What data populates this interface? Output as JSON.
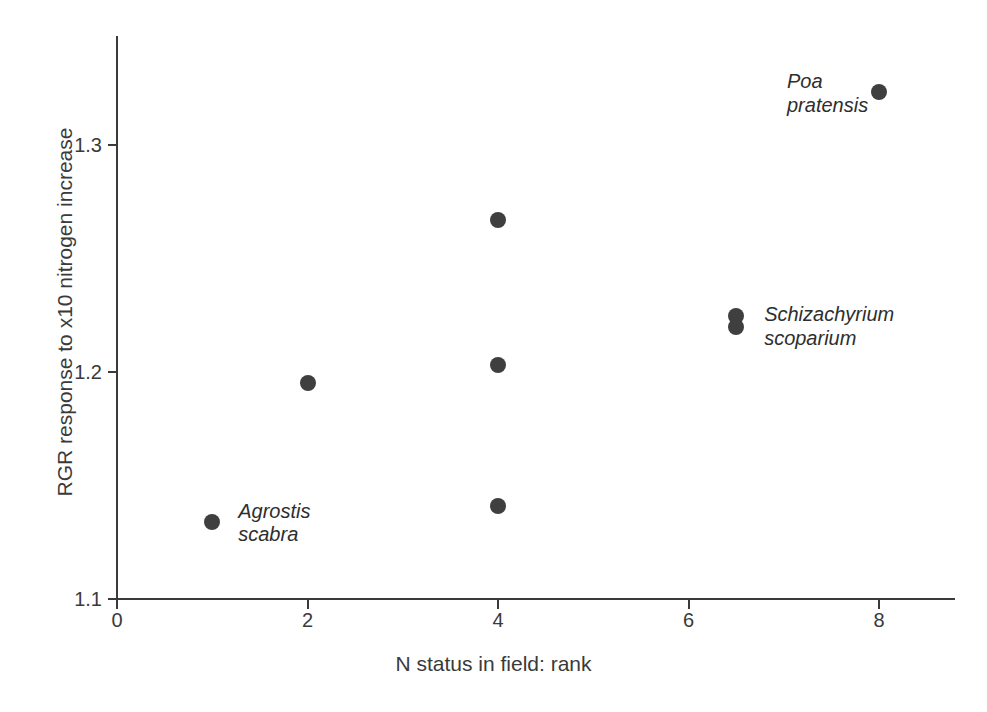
{
  "chart_data": {
    "type": "scatter",
    "title": "",
    "xlabel": "N status in field: rank",
    "ylabel": "RGR response to x10 nitrogen increase",
    "xlim": [
      0,
      8.75
    ],
    "ylim": [
      1.1,
      1.348
    ],
    "xticks": [
      0,
      2,
      4,
      6,
      8
    ],
    "xticklabels": [
      "0",
      "2",
      "4",
      "6",
      "8"
    ],
    "yticks": [
      1.1,
      1.2,
      1.3
    ],
    "yticklabels": [
      "1.1",
      "1.2",
      "1.3"
    ],
    "grid": false,
    "legend": "none",
    "marker_color": "#3f3f3f",
    "axis_color": "#3a3a3a",
    "points": [
      {
        "x": 1,
        "y": 1.134,
        "label": "Agrostis\nscabra",
        "label_dx": 26,
        "label_dy": -22
      },
      {
        "x": 2,
        "y": 1.195,
        "label": "",
        "label_dx": 0,
        "label_dy": 0
      },
      {
        "x": 4,
        "y": 1.267,
        "label": "",
        "label_dx": 0,
        "label_dy": 0
      },
      {
        "x": 4,
        "y": 1.203,
        "label": "",
        "label_dx": 0,
        "label_dy": 0
      },
      {
        "x": 4,
        "y": 1.141,
        "label": "",
        "label_dx": 0,
        "label_dy": 0
      },
      {
        "x": 6.5,
        "y": 1.2246,
        "label": "",
        "label_dx": 0,
        "label_dy": 0
      },
      {
        "x": 6.5,
        "y": 1.2198,
        "label": "Schizachyrium\nscoparium",
        "label_dx": 28,
        "label_dy": -24
      },
      {
        "x": 8,
        "y": 1.3233,
        "label": "Poa\npratensis",
        "label_dx": -92,
        "label_dy": -22
      }
    ]
  }
}
